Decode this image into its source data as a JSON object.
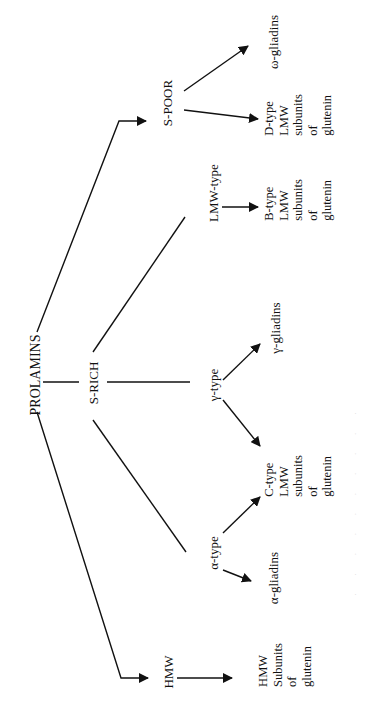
{
  "diagram": {
    "orientation": "rotated-90-ccw",
    "nodes": {
      "prolamins": "PROLAMINS",
      "s_rich": "S-RICH",
      "s_poor": "S-POOR",
      "hmw": "HMW",
      "lmw_type": "LMW-type",
      "gamma_type": "γ-type",
      "alpha_type": "α-type",
      "omega_gliadins": "ω-gliadins",
      "gamma_gliadins": "γ-gliadins",
      "alpha_gliadins": "α-gliadins"
    },
    "blocks": {
      "d_type": [
        "D-type",
        "LMW",
        "subunits",
        "of",
        "glutenin"
      ],
      "b_type": [
        "B-type",
        "LMW",
        "subunits",
        "of",
        "glutenin"
      ],
      "c_type": [
        "C-type",
        "LMW",
        "subunits",
        "of",
        "glutenin"
      ],
      "hmw_subunits": [
        "HMW",
        "Subunits",
        "of",
        "glutenin"
      ]
    },
    "edges": [
      {
        "from": "PROLAMINS",
        "to": "S-POOR",
        "arrow": true
      },
      {
        "from": "PROLAMINS",
        "to": "S-RICH",
        "arrow": false
      },
      {
        "from": "PROLAMINS",
        "to": "HMW",
        "arrow": true
      },
      {
        "from": "S-RICH",
        "to": "LMW-type",
        "arrow": false
      },
      {
        "from": "S-RICH",
        "to": "γ-type",
        "arrow": false
      },
      {
        "from": "S-RICH",
        "to": "α-type",
        "arrow": false
      },
      {
        "from": "S-POOR",
        "to": "ω-gliadins",
        "arrow": true
      },
      {
        "from": "S-POOR",
        "to": "D-type LMW subunits of glutenin",
        "arrow": true
      },
      {
        "from": "LMW-type",
        "to": "B-type LMW subunits of glutenin",
        "arrow": true
      },
      {
        "from": "γ-type",
        "to": "γ-gliadins",
        "arrow": true
      },
      {
        "from": "γ-type",
        "to": "C-type LMW subunits of glutenin",
        "arrow": true
      },
      {
        "from": "α-type",
        "to": "C-type LMW subunits of glutenin",
        "arrow": true
      },
      {
        "from": "α-type",
        "to": "α-gliadins",
        "arrow": true
      },
      {
        "from": "HMW",
        "to": "HMW Subunits of glutenin",
        "arrow": true
      }
    ],
    "caption": "· · · · · · · · · ·",
    "colors": {
      "ink": "#111111",
      "background": "#ffffff",
      "caption": "#cfcfcf"
    }
  }
}
